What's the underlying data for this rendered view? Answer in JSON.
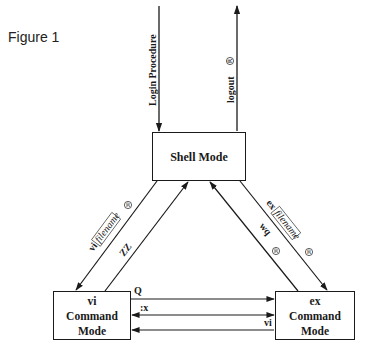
{
  "figure": {
    "label": "Figure 1"
  },
  "nodes": {
    "shell": {
      "label": "Shell Mode"
    },
    "vi": {
      "line1": "vi",
      "line2": "Command",
      "line3": "Mode"
    },
    "ex": {
      "line1": "ex",
      "line2": "Command",
      "line3": "Mode"
    }
  },
  "edges": {
    "login": {
      "label": "Login Procedure"
    },
    "logout": {
      "label": "logout",
      "key_symbol": "R"
    },
    "shell_to_vi": {
      "command": "vi",
      "argument": "filename",
      "key_symbol": "R"
    },
    "vi_to_shell": {
      "label": "ZZ"
    },
    "ex_to_shell": {
      "label": "wq",
      "key_symbol": "R"
    },
    "shell_to_ex": {
      "command": "ex",
      "argument": "filename",
      "key_symbol": "R"
    },
    "vi_to_ex_q": {
      "label": "Q"
    },
    "ex_vi_x": {
      "label": ":x"
    },
    "ex_to_vi": {
      "label": "vi"
    }
  },
  "colors": {
    "line": "#1a1a1a",
    "background": "#ffffff"
  }
}
